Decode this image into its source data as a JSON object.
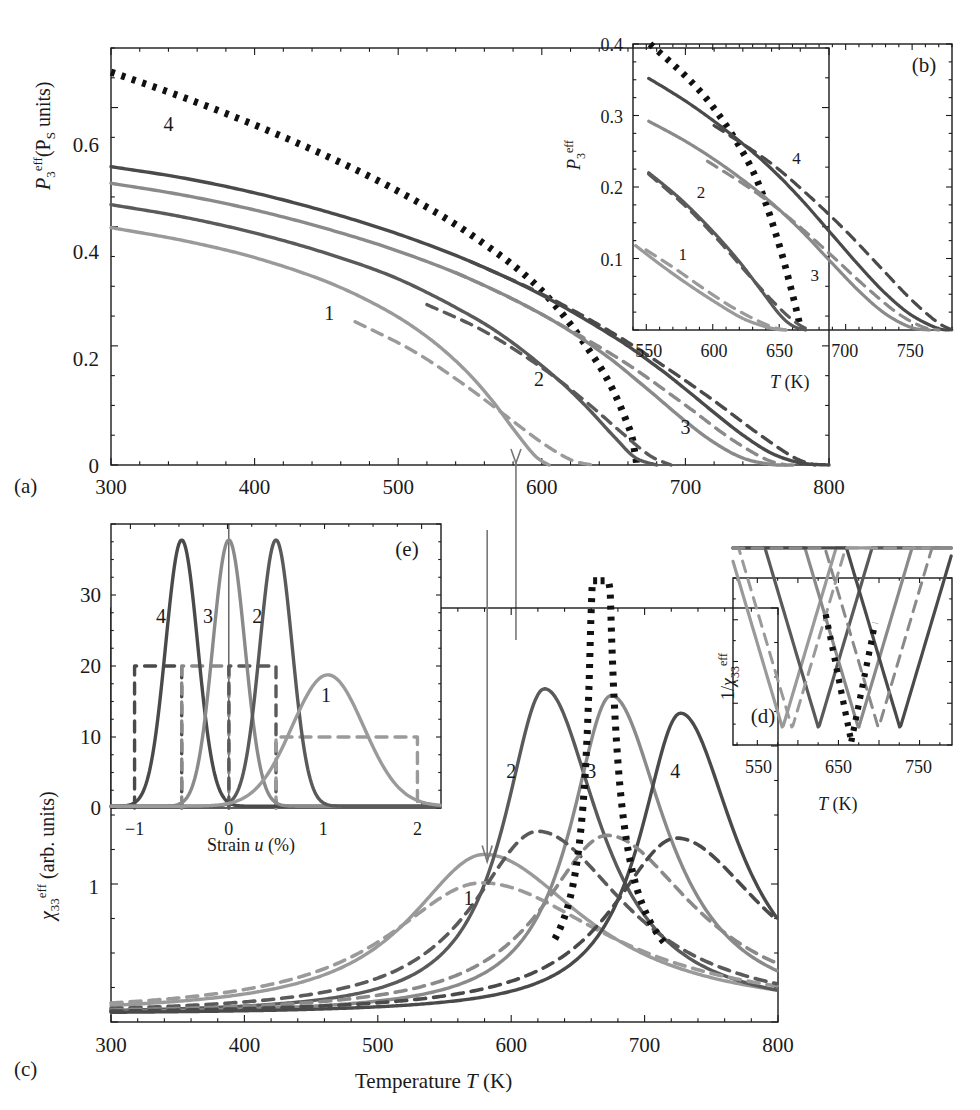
{
  "figure": {
    "kind": "multi-panel-scientific-figure",
    "panels": [
      "a",
      "b",
      "c",
      "d",
      "e"
    ],
    "colors": {
      "curve1": "#9a9a9a",
      "curve2": "#5a5a5a",
      "curve3": "#8a8a8a",
      "curve4": "#4a4a4a",
      "dotted": "#111111",
      "axis": "#1a1a1a",
      "arrow": "#777777"
    }
  },
  "panel_a": {
    "label": "(a)",
    "ylabel_main": "P",
    "ylabel_sub": "3",
    "ylabel_sup": "eff",
    "ylabel_paren": "(P",
    "ylabel_paren_sub": "S",
    "ylabel_paren_rest": " units)",
    "xticks": [
      "300",
      "400",
      "500",
      "600",
      "700",
      "800"
    ],
    "yticks": [
      "0",
      "0.2",
      "0.4",
      "0.6"
    ],
    "xlim": [
      300,
      800
    ],
    "ylim": [
      0,
      0.78
    ],
    "curve_labels": [
      {
        "text": "4",
        "x": 340,
        "y": 0.625
      },
      {
        "text": "1",
        "x": 452,
        "y": 0.272
      },
      {
        "text": "2",
        "x": 598,
        "y": 0.148
      },
      {
        "text": "3",
        "x": 700,
        "y": 0.058
      }
    ]
  },
  "panel_b": {
    "label": "(b)",
    "ylabel_main": "P",
    "ylabel_sub": "3",
    "ylabel_sup": "eff",
    "xlabel_main": "T",
    "xlabel_unit": " (K)",
    "xticks": [
      "550",
      "600",
      "650",
      "700",
      "750"
    ],
    "yticks": [
      "0.1",
      "0.2",
      "0.3",
      "0.4"
    ],
    "xlim": [
      538,
      782
    ],
    "ylim": [
      0,
      0.4
    ],
    "curve_labels": [
      {
        "text": "4",
        "x": 663,
        "y": 0.232
      },
      {
        "text": "2",
        "x": 590,
        "y": 0.185
      },
      {
        "text": "1",
        "x": 576,
        "y": 0.098
      },
      {
        "text": "3",
        "x": 677,
        "y": 0.068
      }
    ]
  },
  "panel_c": {
    "label": "(c)",
    "ylabel_main": "χ",
    "ylabel_sub": "33",
    "ylabel_sup": "eff",
    "ylabel_rest": " (arb. units)",
    "xlabel_word": "Temperature ",
    "xlabel_main": "T",
    "xlabel_unit": " (K)",
    "xticks": [
      "300",
      "400",
      "500",
      "600",
      "700",
      "800"
    ],
    "yticks": [
      "1"
    ],
    "xlim": [
      300,
      800
    ],
    "ylim": [
      0,
      3.05
    ],
    "curve_labels": [
      {
        "text": "1",
        "x": 568,
        "y": 0.86
      },
      {
        "text": "2",
        "x": 600,
        "y": 1.8
      },
      {
        "text": "3",
        "x": 660,
        "y": 1.8
      },
      {
        "text": "4",
        "x": 723,
        "y": 1.8
      }
    ]
  },
  "panel_d": {
    "label": "(d)",
    "ylabel_pre": "1/",
    "ylabel_main": "χ",
    "ylabel_sub": "33",
    "ylabel_sup": "eff",
    "xlabel_main": "T",
    "xlabel_unit": " (K)",
    "xticks": [
      "550",
      "650",
      "750"
    ],
    "xlim": [
      518,
      792
    ]
  },
  "panel_e": {
    "label": "(e)",
    "xlabel_word": "Strain ",
    "xlabel_main": "u",
    "xlabel_unit": " (%)",
    "xticks": [
      "−1",
      "0",
      "1",
      "2"
    ],
    "yticks": [
      "0",
      "10",
      "20",
      "30"
    ],
    "xlim": [
      -1.25,
      2.25
    ],
    "ylim": [
      0,
      40
    ],
    "curve_labels": [
      {
        "text": "4",
        "x": -0.72,
        "y": 26
      },
      {
        "text": "3",
        "x": -0.22,
        "y": 26
      },
      {
        "text": "2",
        "x": 0.3,
        "y": 26
      },
      {
        "text": "1",
        "x": 1.03,
        "y": 15
      }
    ]
  },
  "chart_data": [
    {
      "id": "panel_a",
      "type": "line",
      "title": "",
      "xlabel": "T (K)",
      "ylabel": "P3eff (PS units)",
      "xlim": [
        300,
        800
      ],
      "ylim": [
        0,
        0.78
      ],
      "grid": false,
      "legend": "inline numeric labels 1-4",
      "series": [
        {
          "name": "bulk (dotted)",
          "style": "dotted",
          "color": "#111111",
          "x": [
            300,
            350,
            400,
            450,
            500,
            550,
            600,
            640,
            660,
            665,
            666
          ],
          "y": [
            0.735,
            0.688,
            0.636,
            0.578,
            0.512,
            0.432,
            0.326,
            0.186,
            0.075,
            0.02,
            0.0
          ]
        },
        {
          "name": "4 solid",
          "style": "solid",
          "color": "#4a4a4a",
          "x": [
            300,
            350,
            400,
            450,
            500,
            550,
            600,
            650,
            680,
            700,
            720,
            740,
            760,
            780,
            800
          ],
          "y": [
            0.558,
            0.537,
            0.509,
            0.474,
            0.432,
            0.381,
            0.318,
            0.24,
            0.184,
            0.142,
            0.098,
            0.056,
            0.022,
            0.004,
            0.0
          ]
        },
        {
          "name": "4 dashed",
          "style": "dashed",
          "color": "#4a4a4a",
          "x": [
            550,
            600,
            650,
            690,
            720,
            750,
            775,
            790
          ],
          "y": [
            0.381,
            0.32,
            0.246,
            0.176,
            0.12,
            0.06,
            0.015,
            0.0
          ]
        },
        {
          "name": "3 solid",
          "style": "solid",
          "color": "#8a8a8a",
          "x": [
            300,
            350,
            400,
            450,
            500,
            550,
            600,
            640,
            670,
            700,
            720,
            740,
            760,
            775
          ],
          "y": [
            0.527,
            0.505,
            0.477,
            0.442,
            0.4,
            0.348,
            0.282,
            0.214,
            0.15,
            0.082,
            0.042,
            0.013,
            0.001,
            0.0
          ]
        },
        {
          "name": "3 dashed",
          "style": "dashed",
          "color": "#8a8a8a",
          "x": [
            540,
            580,
            620,
            660,
            700,
            730,
            755,
            770
          ],
          "y": [
            0.36,
            0.31,
            0.252,
            0.188,
            0.112,
            0.052,
            0.012,
            0.0
          ]
        },
        {
          "name": "2 solid",
          "style": "solid",
          "color": "#5a5a5a",
          "x": [
            300,
            350,
            400,
            450,
            500,
            550,
            580,
            610,
            630,
            650,
            665,
            680
          ],
          "y": [
            0.487,
            0.464,
            0.434,
            0.396,
            0.348,
            0.28,
            0.228,
            0.163,
            0.112,
            0.054,
            0.014,
            0.0
          ]
        },
        {
          "name": "2 dashed",
          "style": "dashed",
          "color": "#5a5a5a",
          "x": [
            520,
            560,
            600,
            630,
            655,
            675,
            690
          ],
          "y": [
            0.3,
            0.25,
            0.182,
            0.12,
            0.062,
            0.018,
            0.0
          ]
        },
        {
          "name": "1 solid",
          "style": "solid",
          "color": "#9a9a9a",
          "x": [
            300,
            350,
            400,
            450,
            490,
            520,
            545,
            565,
            580,
            595,
            605
          ],
          "y": [
            0.444,
            0.42,
            0.388,
            0.343,
            0.292,
            0.24,
            0.182,
            0.122,
            0.068,
            0.018,
            0.0
          ]
        },
        {
          "name": "1 dashed",
          "style": "dashed",
          "color": "#9a9a9a",
          "x": [
            470,
            510,
            545,
            575,
            600,
            620,
            635
          ],
          "y": [
            0.268,
            0.214,
            0.152,
            0.092,
            0.042,
            0.01,
            0.0
          ]
        }
      ]
    },
    {
      "id": "panel_b",
      "type": "line",
      "title": "(b) zoom of panel (a) tail region",
      "xlabel": "T (K)",
      "ylabel": "P3eff",
      "xlim": [
        538,
        782
      ],
      "ylim": [
        0,
        0.4
      ],
      "grid": false,
      "series": [
        {
          "name": "bulk (dotted)",
          "style": "dotted",
          "color": "#111111",
          "x": [
            551,
            580,
            600,
            620,
            635,
            650,
            660,
            665,
            666
          ],
          "y": [
            0.4,
            0.352,
            0.31,
            0.255,
            0.2,
            0.118,
            0.05,
            0.012,
            0.0
          ]
        },
        {
          "name": "4 solid",
          "style": "solid",
          "color": "#4a4a4a",
          "x": [
            550,
            580,
            610,
            640,
            665,
            690,
            710,
            730,
            750,
            770,
            780
          ],
          "y": [
            0.352,
            0.318,
            0.278,
            0.232,
            0.186,
            0.134,
            0.092,
            0.053,
            0.022,
            0.003,
            0.0
          ]
        },
        {
          "name": "4 dashed",
          "style": "dashed",
          "color": "#4a4a4a",
          "x": [
            600,
            640,
            670,
            700,
            725,
            750,
            770,
            782
          ],
          "y": [
            0.286,
            0.238,
            0.192,
            0.14,
            0.092,
            0.044,
            0.012,
            0.0
          ]
        },
        {
          "name": "3 solid",
          "style": "solid",
          "color": "#8a8a8a",
          "x": [
            550,
            580,
            610,
            640,
            665,
            690,
            710,
            730,
            750,
            765
          ],
          "y": [
            0.292,
            0.262,
            0.226,
            0.184,
            0.142,
            0.094,
            0.056,
            0.024,
            0.004,
            0.0
          ]
        },
        {
          "name": "3 dashed",
          "style": "dashed",
          "color": "#8a8a8a",
          "x": [
            595,
            630,
            660,
            690,
            715,
            740,
            760,
            772
          ],
          "y": [
            0.236,
            0.195,
            0.153,
            0.104,
            0.062,
            0.024,
            0.004,
            0.0
          ]
        },
        {
          "name": "2 solid",
          "style": "solid",
          "color": "#5a5a5a",
          "x": [
            550,
            575,
            600,
            620,
            635,
            650,
            660,
            670
          ],
          "y": [
            0.22,
            0.182,
            0.136,
            0.094,
            0.058,
            0.022,
            0.006,
            0.0
          ]
        },
        {
          "name": "2 dashed",
          "style": "dashed",
          "color": "#5a5a5a",
          "x": [
            550,
            580,
            605,
            625,
            645,
            660,
            672
          ],
          "y": [
            0.218,
            0.17,
            0.122,
            0.08,
            0.04,
            0.014,
            0.0
          ]
        },
        {
          "name": "1 solid",
          "style": "solid",
          "color": "#9a9a9a",
          "x": [
            540,
            560,
            580,
            600,
            620,
            635,
            648,
            655
          ],
          "y": [
            0.118,
            0.09,
            0.064,
            0.04,
            0.018,
            0.007,
            0.001,
            0.0
          ]
        },
        {
          "name": "1 dashed",
          "style": "dashed",
          "color": "#9a9a9a",
          "x": [
            548,
            570,
            592,
            612,
            630,
            645,
            655
          ],
          "y": [
            0.112,
            0.086,
            0.058,
            0.034,
            0.016,
            0.004,
            0.0
          ]
        }
      ]
    },
    {
      "id": "panel_c",
      "type": "line",
      "title": "",
      "xlabel": "Temperature T (K)",
      "ylabel": "chi33eff (arb. units)",
      "xlim": [
        300,
        800
      ],
      "ylim": [
        0,
        3.05
      ],
      "grid": false,
      "peaks": [
        {
          "name": "1",
          "center": 580,
          "height": 1.18,
          "width": 60,
          "color": "#9a9a9a"
        },
        {
          "name": "2",
          "center": 625,
          "height": 2.4,
          "width": 32,
          "color": "#5a5a5a"
        },
        {
          "name": "3",
          "center": 675,
          "height": 2.35,
          "width": 32,
          "color": "#8a8a8a"
        },
        {
          "name": "4",
          "center": 727,
          "height": 2.22,
          "width": 32,
          "color": "#4a4a4a"
        },
        {
          "name": "1 dashed",
          "center": 578,
          "height": 0.97,
          "width": 75,
          "color": "#9a9a9a",
          "style": "dashed"
        },
        {
          "name": "2 dashed",
          "center": 620,
          "height": 1.35,
          "width": 52,
          "color": "#5a5a5a",
          "style": "dashed"
        },
        {
          "name": "3 dashed",
          "center": 672,
          "height": 1.32,
          "width": 52,
          "color": "#8a8a8a",
          "style": "dashed"
        },
        {
          "name": "4 dashed",
          "center": 724,
          "height": 1.3,
          "width": 52,
          "color": "#4a4a4a",
          "style": "dashed"
        }
      ],
      "divergence": {
        "name": "bulk (dotted)",
        "center": 666,
        "color": "#111111"
      }
    },
    {
      "id": "panel_d",
      "type": "line",
      "title": "(d) inverse susceptibility",
      "xlabel": "T (K)",
      "ylabel": "1/chi33eff",
      "xlim": [
        518,
        792
      ],
      "grid": false,
      "minima": [
        {
          "name": "1",
          "center": 580,
          "color": "#9a9a9a"
        },
        {
          "name": "2",
          "center": 625,
          "color": "#5a5a5a"
        },
        {
          "name": "3",
          "center": 675,
          "color": "#8a8a8a"
        },
        {
          "name": "4",
          "center": 727,
          "color": "#4a4a4a"
        },
        {
          "name": "1 dashed",
          "center": 592,
          "color": "#9a9a9a",
          "style": "dashed"
        },
        {
          "name": "3 dashed",
          "center": 700,
          "color": "#8a8a8a",
          "style": "dashed"
        }
      ],
      "divergence": {
        "center": 666,
        "color": "#111111"
      }
    },
    {
      "id": "panel_e",
      "type": "line",
      "title": "(e) strain distributions",
      "xlabel": "Strain u (%)",
      "ylabel": "",
      "xlim": [
        -1.25,
        2.25
      ],
      "ylim": [
        0,
        40
      ],
      "grid": false,
      "gaussians": [
        {
          "name": "4",
          "center": -0.5,
          "height": 37.5,
          "sigma": 0.17,
          "color": "#4a4a4a"
        },
        {
          "name": "3",
          "center": 0.0,
          "height": 37.5,
          "sigma": 0.17,
          "color": "#8a8a8a"
        },
        {
          "name": "2",
          "center": 0.5,
          "height": 37.5,
          "sigma": 0.17,
          "color": "#5a5a5a"
        },
        {
          "name": "1",
          "center": 1.05,
          "height": 18.5,
          "sigma": 0.38,
          "color": "#9a9a9a"
        }
      ],
      "rectangles": [
        {
          "name": "4 box",
          "x0": -1.0,
          "x1": -0.5,
          "height": 20,
          "color": "#4a4a4a",
          "style": "dashed"
        },
        {
          "name": "3 box",
          "x0": -0.5,
          "x1": 0.0,
          "height": 20,
          "color": "#8a8a8a",
          "style": "dashed"
        },
        {
          "name": "2 box",
          "x0": 0.0,
          "x1": 0.5,
          "height": 20,
          "color": "#5a5a5a",
          "style": "dashed"
        },
        {
          "name": "1 box",
          "x0": 0.5,
          "x1": 2.0,
          "height": 10,
          "color": "#9a9a9a",
          "style": "dashed"
        }
      ]
    }
  ]
}
